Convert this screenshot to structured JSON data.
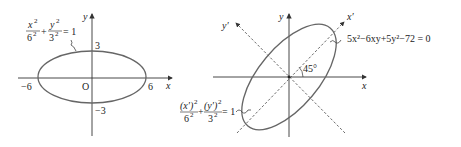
{
  "left_figure": {
    "equation": {
      "x_num": "x",
      "x_exp": "2",
      "x_den": "6",
      "x_den_exp": "2",
      "plus": "+",
      "y_num": "y",
      "y_exp": "2",
      "y_den": "3",
      "y_den_exp": "2",
      "rhs": "= 1"
    },
    "axis_labels": {
      "x": "x",
      "y": "y"
    },
    "ticks": {
      "pos_x": "6",
      "neg_x": "−6",
      "pos_y": "3",
      "neg_y": "−3",
      "origin": "O"
    },
    "semi_major": 6,
    "semi_minor": 3
  },
  "right_figure": {
    "equation_original": "5x²−6xy+5y²−72 = 0",
    "equation_rotated": {
      "xp_num": "(x′)",
      "xp_exp": "2",
      "xp_den": "6",
      "xp_den_exp": "2",
      "plus": "+",
      "yp_num": "(y′)",
      "yp_exp": "2",
      "yp_den": "3",
      "yp_den_exp": "2",
      "rhs": "= 1"
    },
    "axis_labels": {
      "x": "x",
      "y": "y",
      "x_prime": "x′",
      "y_prime": "y′"
    },
    "rotation_angle": "45°",
    "semi_major": 6,
    "semi_minor": 3
  },
  "colors": {
    "curve": "#666666",
    "axis": "#333333",
    "text": "#222222"
  }
}
